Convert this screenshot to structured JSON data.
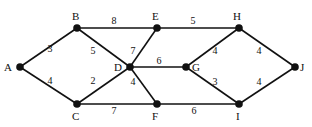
{
  "graph": {
    "type": "weighted-undirected",
    "nodes": [
      {
        "id": "A",
        "x": 20,
        "y": 67,
        "lx": 4,
        "ly": 71
      },
      {
        "id": "B",
        "x": 77,
        "y": 28,
        "lx": 72,
        "ly": 20
      },
      {
        "id": "C",
        "x": 77,
        "y": 104,
        "lx": 72,
        "ly": 120
      },
      {
        "id": "D",
        "x": 130,
        "y": 67,
        "lx": 114,
        "ly": 71
      },
      {
        "id": "E",
        "x": 157,
        "y": 28,
        "lx": 152,
        "ly": 20
      },
      {
        "id": "F",
        "x": 157,
        "y": 104,
        "lx": 152,
        "ly": 120
      },
      {
        "id": "G",
        "x": 186,
        "y": 67,
        "lx": 192,
        "ly": 71
      },
      {
        "id": "H",
        "x": 239,
        "y": 28,
        "lx": 233,
        "ly": 20
      },
      {
        "id": "I",
        "x": 239,
        "y": 104,
        "lx": 236,
        "ly": 120
      },
      {
        "id": "J",
        "x": 295,
        "y": 67,
        "lx": 300,
        "ly": 71
      }
    ],
    "edges": [
      {
        "from": "A",
        "to": "B",
        "weight": "3",
        "wx": 50,
        "wy": 52
      },
      {
        "from": "A",
        "to": "C",
        "weight": "4",
        "wx": 50,
        "wy": 84
      },
      {
        "from": "B",
        "to": "E",
        "weight": "8",
        "wx": 114,
        "wy": 24
      },
      {
        "from": "B",
        "to": "D",
        "weight": "5",
        "wx": 93,
        "wy": 54
      },
      {
        "from": "C",
        "to": "D",
        "weight": "2",
        "wx": 93,
        "wy": 84
      },
      {
        "from": "C",
        "to": "F",
        "weight": "7",
        "wx": 114,
        "wy": 114
      },
      {
        "from": "D",
        "to": "E",
        "weight": "7",
        "wx": 133,
        "wy": 54
      },
      {
        "from": "D",
        "to": "G",
        "weight": "6",
        "wx": 159,
        "wy": 64
      },
      {
        "from": "D",
        "to": "F",
        "weight": "4",
        "wx": 133,
        "wy": 85
      },
      {
        "from": "E",
        "to": "H",
        "weight": "5",
        "wx": 193,
        "wy": 24
      },
      {
        "from": "G",
        "to": "H",
        "weight": "4",
        "wx": 215,
        "wy": 54
      },
      {
        "from": "G",
        "to": "I",
        "weight": "3",
        "wx": 215,
        "wy": 85
      },
      {
        "from": "F",
        "to": "I",
        "weight": "6",
        "wx": 194,
        "wy": 114
      },
      {
        "from": "H",
        "to": "J",
        "weight": "4",
        "wx": 259,
        "wy": 54
      },
      {
        "from": "I",
        "to": "J",
        "weight": "4",
        "wx": 259,
        "wy": 85
      }
    ]
  }
}
